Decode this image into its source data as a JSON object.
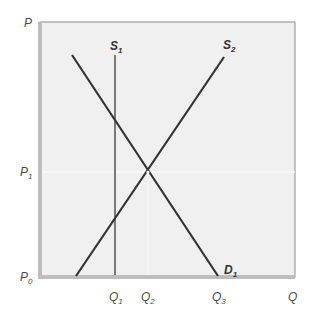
{
  "diagram": {
    "type": "supply-demand",
    "axes": {
      "y_label": "P",
      "x_label": "Q",
      "y_ticks": [
        {
          "base": "P",
          "sub": "1"
        },
        {
          "base": "P",
          "sub": "0"
        }
      ],
      "x_ticks": [
        {
          "base": "Q",
          "sub": "1"
        },
        {
          "base": "Q",
          "sub": "2"
        },
        {
          "base": "Q",
          "sub": "3"
        }
      ]
    },
    "curves": [
      {
        "name": "S1",
        "base": "S",
        "sub": "1",
        "kind": "vertical supply"
      },
      {
        "name": "S2",
        "base": "S",
        "sub": "2",
        "kind": "upward-sloping supply"
      },
      {
        "name": "D1",
        "base": "D",
        "sub": "1",
        "kind": "downward-sloping demand"
      }
    ],
    "colors": {
      "background": "#ffffff",
      "plot_area": "#f0f0f0",
      "axis": "#bdbdbd",
      "frame": "#8c8c8c",
      "s1_line": "#7a7a7a",
      "curve_line": "#333333",
      "label": "#4a4a4a"
    }
  }
}
